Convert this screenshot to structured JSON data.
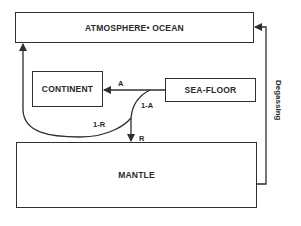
{
  "diagram": {
    "boxes": {
      "atmosphere_ocean": "ATMOSPHERE• OCEAN",
      "continent": "CONTINENT",
      "sea_floor": "SEA-FLOOR",
      "mantle": "MANTLE"
    },
    "flows": {
      "sea_floor_to_continent": "A",
      "sea_floor_subducted": "1-A",
      "to_atmosphere_ocean": "1-R",
      "to_mantle": "R",
      "mantle_to_atmosphere": "Degassing"
    },
    "colors": {
      "line": "#2f2f2f",
      "background": "#ffffff"
    }
  }
}
